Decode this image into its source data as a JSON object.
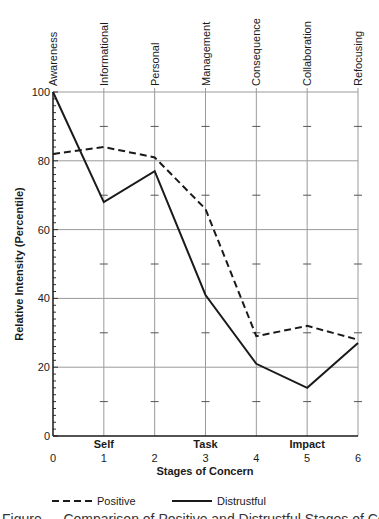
{
  "chart_data": {
    "type": "line",
    "title": "",
    "xlabel": "Stages of Concern",
    "ylabel": "Relative Intensity (Percentile)",
    "x": [
      0,
      1,
      2,
      3,
      4,
      5,
      6
    ],
    "x_tick_labels": [
      "0",
      "1",
      "2",
      "3",
      "4",
      "5",
      "6"
    ],
    "top_category_labels": [
      "Awareness",
      "Informational",
      "Personal",
      "Management",
      "Consequence",
      "Collaboration",
      "Refocusing"
    ],
    "group_labels": [
      {
        "label": "Self",
        "x": 1
      },
      {
        "label": "Task",
        "x": 3
      },
      {
        "label": "Impact",
        "x": 5
      }
    ],
    "y_ticks": [
      0,
      20,
      40,
      60,
      80,
      100
    ],
    "y_tick_labels": [
      "0",
      "20",
      "40",
      "60",
      "80",
      "100"
    ],
    "ylim": [
      0,
      100
    ],
    "xlim": [
      0,
      6
    ],
    "grid": true,
    "legend_position": "bottom",
    "series": [
      {
        "name": "Positive",
        "style": "dashed",
        "color": "#1a1a1a",
        "values": [
          82,
          84,
          81,
          66,
          29,
          32,
          28
        ]
      },
      {
        "name": "Distrustful",
        "style": "solid",
        "color": "#1a1a1a",
        "values": [
          100,
          68,
          77,
          41,
          21,
          14,
          27
        ]
      }
    ]
  },
  "caption": "Figure — Comparison of Positive and Distrustful Stages of Concern Profiles"
}
